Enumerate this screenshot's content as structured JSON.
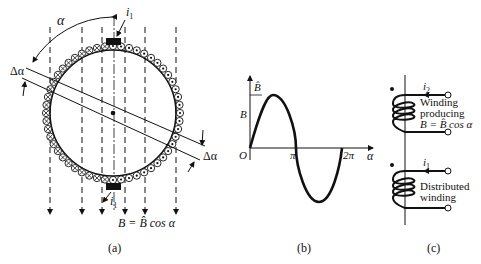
{
  "panels": {
    "a": {
      "caption": "(a)",
      "labels": {
        "alpha": "α",
        "delta_alpha_left": "Δα",
        "delta_alpha_right": "Δα",
        "current_top": "i",
        "current_top_sub": "1",
        "current_bottom": "i",
        "current_bottom_sub": "1",
        "field_equation": "B = B̂ cos α"
      }
    },
    "b": {
      "caption": "(b)",
      "labels": {
        "y_axis": "B",
        "peak": "B̂",
        "origin": "O",
        "pi": "π",
        "two_pi": "2π",
        "x_axis": "α"
      }
    },
    "c": {
      "caption": "(c)",
      "winding_top": {
        "current": "i",
        "current_sub": "2",
        "line1": "Winding",
        "line2": "producing",
        "line3": "B = B̂ cos α"
      },
      "winding_bottom": {
        "current": "i",
        "current_sub": "1",
        "line1": "Distributed",
        "line2": "winding"
      }
    }
  }
}
